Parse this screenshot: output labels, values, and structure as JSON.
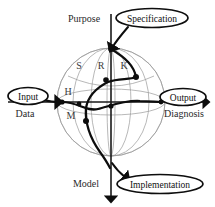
{
  "diagram": {
    "axes": {
      "vertical": {
        "top_label": "Purpose",
        "bottom_label": "Model"
      },
      "horizontal": {
        "left_label": "Data",
        "right_label": "Diagnosis"
      }
    },
    "sphere_letters": [
      {
        "id": "S",
        "label": "S",
        "x": 79,
        "y": 65
      },
      {
        "id": "R",
        "label": "R",
        "x": 101,
        "y": 65
      },
      {
        "id": "K",
        "label": "K",
        "x": 124,
        "y": 65
      },
      {
        "id": "H",
        "label": "H",
        "x": 68,
        "y": 91
      },
      {
        "id": "M",
        "label": "M",
        "x": 71,
        "y": 115
      }
    ],
    "callouts": [
      {
        "id": "specification",
        "label": "Specification",
        "cx": 152,
        "cy": 18,
        "rx": 36,
        "ry": 9
      },
      {
        "id": "input",
        "label": "Input",
        "cx": 28,
        "cy": 96,
        "rx": 20,
        "ry": 8
      },
      {
        "id": "output",
        "label": "Output",
        "cx": 183,
        "cy": 97,
        "rx": 23,
        "ry": 8
      },
      {
        "id": "implementation",
        "label": "Implementation",
        "cx": 160,
        "cy": 184,
        "rx": 43,
        "ry": 9
      }
    ],
    "colors": {
      "wireframe": "#9a9a9a",
      "axis": "#1a1a1a",
      "path": "#0d0d0d",
      "text": "#2a2a2a",
      "background": "#ffffff"
    },
    "nodes": [
      {
        "id": "n1",
        "x": 62,
        "y": 102
      },
      {
        "id": "n2",
        "x": 79,
        "y": 104
      },
      {
        "id": "n3",
        "x": 86,
        "y": 121
      },
      {
        "id": "n4",
        "x": 90,
        "y": 110
      },
      {
        "id": "n5",
        "x": 111,
        "y": 106
      },
      {
        "id": "n6",
        "x": 106,
        "y": 80
      },
      {
        "id": "n7",
        "x": 134,
        "y": 78
      },
      {
        "id": "n8",
        "x": 161,
        "y": 102
      }
    ]
  }
}
